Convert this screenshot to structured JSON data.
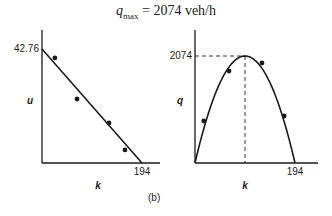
{
  "title": {
    "symbol": "q",
    "subscript": "max",
    "equals": "=",
    "value": "2074 veh/h"
  },
  "panel_label": "(b)",
  "chart_data": [
    {
      "type": "line",
      "title": "",
      "xlabel": "k",
      "ylabel": "u",
      "x_ticks": [
        "194"
      ],
      "y_ticks": [
        "42.76"
      ],
      "xlim": [
        0,
        194
      ],
      "ylim": [
        0,
        42.76
      ],
      "grid": false,
      "series": [
        {
          "name": "fitted line u = 42.76 - 0.2204k",
          "kind": "line",
          "x": [
            0,
            194
          ],
          "y": [
            42.76,
            0
          ]
        },
        {
          "name": "observed",
          "kind": "scatter",
          "x": [
            25,
            68,
            130,
            161
          ],
          "y": [
            39.4,
            24.0,
            15.0,
            4.9
          ]
        }
      ]
    },
    {
      "type": "line",
      "title": "",
      "xlabel": "k",
      "ylabel": "q",
      "x_ticks": [
        "194"
      ],
      "y_ticks": [
        "2074"
      ],
      "xlim": [
        0,
        194
      ],
      "ylim": [
        0,
        2074
      ],
      "grid": false,
      "annotations": [
        "dashed guide from peak (k=97, q=2074) to both axes"
      ],
      "series": [
        {
          "name": "fitted parabola q = 42.76k - 0.2204k^2",
          "kind": "line",
          "x": [
            0,
            24.25,
            48.5,
            72.75,
            97,
            121.25,
            145.5,
            169.75,
            194
          ],
          "y": [
            0,
            907,
            1556,
            1944,
            2074,
            1944,
            1556,
            907,
            0
          ]
        },
        {
          "name": "observed",
          "kind": "scatter",
          "x": [
            17,
            66,
            130,
            173
          ],
          "y": [
            814,
            1783,
            1938,
            911
          ]
        }
      ]
    }
  ]
}
